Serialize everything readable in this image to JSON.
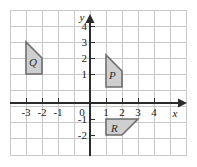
{
  "figure": {
    "background_color": "#ffffff",
    "grid_color": "#c9c9c9",
    "axis_color": "#2b2b2b",
    "shape_fill": "#cfcfcf",
    "shape_stroke": "#6e6e6e",
    "grid_frame": {
      "x": 10,
      "y": 10,
      "width": 176,
      "height": 146
    },
    "cell_size": 16,
    "origin": {
      "x": 90,
      "y": 103
    }
  },
  "axes": {
    "x_axis": {
      "name": "x",
      "tick_labels": [
        "-3",
        "-2",
        "-1",
        "0",
        "1",
        "2",
        "3",
        "4"
      ],
      "tick_values": [
        -3,
        -2,
        -1,
        0,
        1,
        2,
        3,
        4
      ],
      "range": [
        -5,
        6
      ],
      "arrow": "right"
    },
    "y_axis": {
      "name": "y",
      "tick_labels": [
        "4",
        "3",
        "2",
        "1",
        "0",
        "-1",
        "-2"
      ],
      "tick_values": [
        4,
        3,
        2,
        1,
        0,
        -1,
        -2
      ],
      "range": [
        -3,
        5
      ],
      "arrow": "up"
    }
  },
  "shapes": [
    {
      "label": "Q",
      "label_point": [
        -2.6,
        2.9
      ],
      "vertices": [
        [
          -3,
          2
        ],
        [
          -3,
          4
        ],
        [
          -2,
          3
        ],
        [
          -2,
          2
        ]
      ]
    },
    {
      "label": "P",
      "label_point": [
        1.45,
        1.9
      ],
      "vertices": [
        [
          1,
          1
        ],
        [
          1,
          3
        ],
        [
          2,
          2
        ],
        [
          2,
          1
        ]
      ]
    },
    {
      "label": "R",
      "label_point": [
        1.5,
        -1.45
      ],
      "vertices": [
        [
          1,
          -2
        ],
        [
          1,
          -1
        ],
        [
          3,
          -1
        ],
        [
          2,
          -2
        ]
      ]
    }
  ]
}
